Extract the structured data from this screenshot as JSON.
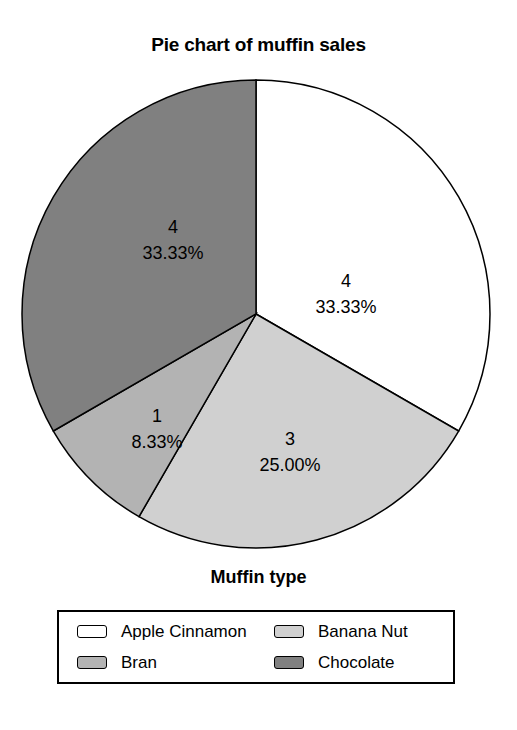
{
  "chart_data": {
    "type": "pie",
    "title": "Pie chart of muffin sales",
    "xlabel": "Muffin type",
    "ylabel": "",
    "legend_position": "bottom",
    "grid": false,
    "total": 12,
    "categories": [
      "Apple Cinnamon",
      "Banana Nut",
      "Bran",
      "Chocolate"
    ],
    "values": [
      4,
      3,
      1,
      4
    ],
    "percents": [
      "33.33%",
      "25.00%",
      "8.33%",
      "33.33%"
    ],
    "colors": [
      "#ffffff",
      "#d0d0d0",
      "#b3b3b3",
      "#808080"
    ],
    "start_angle_deg": 0,
    "direction": "clockwise",
    "slices": [
      {
        "name": "Apple Cinnamon",
        "value": 4,
        "value_text": "4",
        "percent_text": "33.33%",
        "percent": 33.33,
        "color": "#ffffff",
        "start_deg": 0,
        "end_deg": 120,
        "label_x": 330,
        "label_y": 213
      },
      {
        "name": "Banana Nut",
        "value": 3,
        "value_text": "3",
        "percent_text": "25.00%",
        "percent": 25.0,
        "color": "#d0d0d0",
        "start_deg": 120,
        "end_deg": 210,
        "label_x": 274,
        "label_y": 371
      },
      {
        "name": "Bran",
        "value": 1,
        "value_text": "1",
        "percent_text": "8.33%",
        "percent": 8.33,
        "color": "#b3b3b3",
        "start_deg": 210,
        "end_deg": 240,
        "label_x": 141,
        "label_y": 348
      },
      {
        "name": "Chocolate",
        "value": 4,
        "value_text": "4",
        "percent_text": "33.33%",
        "percent": 33.33,
        "color": "#808080",
        "start_deg": 240,
        "end_deg": 360,
        "label_x": 157,
        "label_y": 159
      }
    ]
  },
  "legend": {
    "entries": [
      {
        "label": "Apple Cinnamon",
        "color": "#ffffff"
      },
      {
        "label": "Banana Nut",
        "color": "#d0d0d0"
      },
      {
        "label": "Bran",
        "color": "#b3b3b3"
      },
      {
        "label": "Chocolate",
        "color": "#808080"
      }
    ]
  },
  "style": {
    "outline_color": "#000000",
    "background": "#ffffff"
  }
}
